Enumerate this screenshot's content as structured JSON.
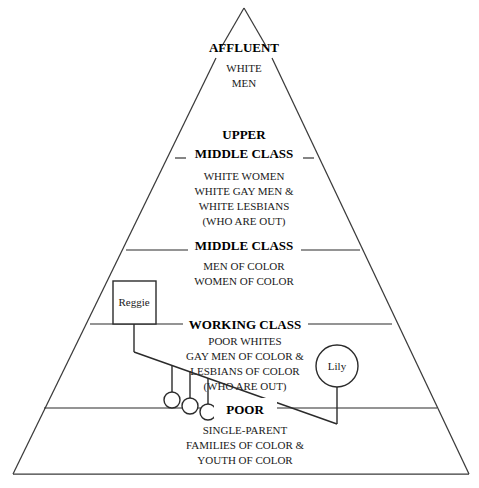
{
  "diagram": {
    "background_color": "#ffffff",
    "line_color": "#2b2b2b",
    "edge_color": "#3a3a3a",
    "text_color": "#000000"
  },
  "pyramid": {
    "apex": {
      "x": 244,
      "y": 8
    },
    "base_left": {
      "x": 13,
      "y": 474
    },
    "base_right": {
      "x": 469,
      "y": 474
    },
    "tiers": [
      {
        "id": "affluent",
        "heading": "AFFLUENT",
        "heading_y": 52,
        "heading_size": 13,
        "lines": [
          "WHITE",
          "MEN"
        ],
        "lines_start_y": 72,
        "line_height": 15,
        "line_size": 11,
        "divider_y": null,
        "divider_left_x1": null,
        "divider_left_x2": null,
        "divider_right_x1": null,
        "divider_right_x2": null
      },
      {
        "id": "upper-middle-class",
        "heading": "UPPER\nMIDDLE CLASS",
        "heading_line_1": "UPPER",
        "heading_line_2": "MIDDLE CLASS",
        "heading_y": 139,
        "heading_size": 13,
        "lines": [
          "WHITE WOMEN",
          "WHITE GAY MEN &",
          "WHITE LESBIANS",
          "(WHO ARE OUT)"
        ],
        "lines_start_y": 177,
        "line_height": 15,
        "line_size": 11,
        "divider_y": 158,
        "divider_left_x1": 175,
        "divider_left_x2": 186,
        "divider_right_x1": 303,
        "divider_right_x2": 314
      },
      {
        "id": "middle-class",
        "heading_line_1": "MIDDLE CLASS",
        "heading_y": 246,
        "heading_size": 13,
        "lines": [
          "MEN OF COLOR",
          "WOMEN OF COLOR"
        ],
        "lines_start_y": 266,
        "line_height": 15,
        "line_size": 11,
        "divider_y": 250,
        "divider_left_x1": 126,
        "divider_left_x2": 188,
        "divider_right_x1": 301,
        "divider_right_x2": 360
      },
      {
        "id": "working-class",
        "heading_line_1": "WORKING CLASS",
        "heading_y": 320,
        "heading_size": 13,
        "lines": [
          "POOR WHITES",
          "GAY MEN OF COLOR &",
          "LESBIANS OF COLOR",
          "(WHO ARE OUT)"
        ],
        "lines_start_y": 336,
        "line_height": 15,
        "line_size": 11,
        "divider_y": 324,
        "divider_left_x1": 90,
        "divider_left_x2": 183,
        "divider_right_x1": 308,
        "divider_right_x2": 392
      },
      {
        "id": "poor",
        "heading_line_1": "POOR",
        "heading_y": 412,
        "heading_size": 13,
        "lines": [
          "SINGLE-PARENT",
          "FAMILIES OF COLOR &",
          "YOUTH OF COLOR"
        ],
        "lines_start_y": 431,
        "line_height": 15,
        "line_size": 11,
        "divider_y": 408,
        "divider_left_x1": 44,
        "divider_left_x2": 214,
        "divider_right_x1": 277,
        "divider_right_x2": 437
      }
    ]
  },
  "genogram": {
    "nodes": [
      {
        "id": "reggie",
        "label": "Reggie",
        "shape": "square",
        "x": 113,
        "y": 281,
        "width": 43,
        "height": 43,
        "label_x": 134,
        "label_y": 306
      },
      {
        "id": "lily",
        "label": "Lily",
        "shape": "circle",
        "cx": 337,
        "cy": 366,
        "r": 21,
        "label_x": 337,
        "label_y": 370
      },
      {
        "id": "child-1",
        "label": "",
        "shape": "circle",
        "cx": 172,
        "cy": 400,
        "r": 8
      },
      {
        "id": "child-2",
        "label": "",
        "shape": "circle",
        "cx": 190,
        "cy": 406,
        "r": 8
      },
      {
        "id": "child-3",
        "label": "",
        "shape": "circle",
        "cx": 208,
        "cy": 412,
        "r": 8
      }
    ],
    "connectors": {
      "reggie_stem": {
        "x": 134,
        "y1": 324,
        "y2": 352
      },
      "lily_stem": {
        "x": 337,
        "y1": 387,
        "y2": 424
      },
      "sibling_diagonal": {
        "x1": 134,
        "y1": 352,
        "x2": 337,
        "y2": 424
      },
      "child_stems": [
        {
          "x": 172,
          "y1": 365,
          "y2": 392
        },
        {
          "x": 190,
          "y1": 371,
          "y2": 398
        },
        {
          "x": 208,
          "y1": 378,
          "y2": 404
        }
      ]
    }
  }
}
